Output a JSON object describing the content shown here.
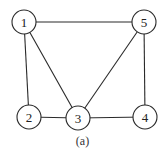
{
  "diagram": {
    "type": "undirected-graph",
    "caption": "(a)",
    "node_radius": 12,
    "nodes": [
      {
        "id": "1",
        "label": "1",
        "x": 24,
        "y": 22
      },
      {
        "id": "2",
        "label": "2",
        "x": 29,
        "y": 117
      },
      {
        "id": "3",
        "label": "3",
        "x": 78,
        "y": 118
      },
      {
        "id": "4",
        "label": "4",
        "x": 145,
        "y": 117
      },
      {
        "id": "5",
        "label": "5",
        "x": 144,
        "y": 22
      }
    ],
    "edges": [
      {
        "from": "1",
        "to": "5"
      },
      {
        "from": "1",
        "to": "2"
      },
      {
        "from": "1",
        "to": "3"
      },
      {
        "from": "5",
        "to": "3"
      },
      {
        "from": "5",
        "to": "4"
      },
      {
        "from": "2",
        "to": "3"
      },
      {
        "from": "3",
        "to": "4"
      }
    ],
    "colors": {
      "stroke": "#2a2a2a",
      "fill": "#ffffff",
      "text": "#222222"
    }
  }
}
